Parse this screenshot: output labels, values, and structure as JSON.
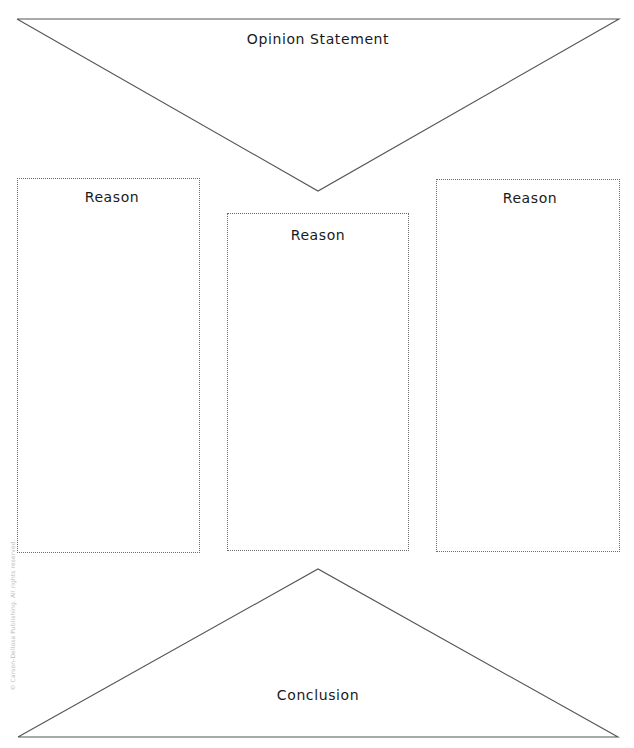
{
  "page": {
    "background_color": "#ffffff",
    "line_color": "#555555",
    "box_border_color": "#6b6b6b",
    "text_color": "#1a1a1a",
    "width": 634,
    "height": 748
  },
  "organizer": {
    "top_section": {
      "label": "Opinion Statement",
      "shape": "downward-triangle",
      "label_x": 318,
      "label_y": 39
    },
    "reason_boxes": [
      {
        "label": "Reason",
        "position": "left",
        "x": 17,
        "y": 178,
        "width": 183,
        "height": 375,
        "label_x": 112,
        "label_y": 197
      },
      {
        "label": "Reason",
        "position": "center",
        "x": 227,
        "y": 213,
        "width": 182,
        "height": 338,
        "label_x": 318,
        "label_y": 235
      },
      {
        "label": "Reason",
        "position": "right",
        "x": 436,
        "y": 179,
        "width": 184,
        "height": 373,
        "label_x": 530,
        "label_y": 198
      }
    ],
    "bottom_section": {
      "label": "Conclusion",
      "shape": "upward-triangle",
      "label_x": 318,
      "label_y": 695
    }
  },
  "footer": {
    "copyright": "© Carson-Dellosa Publishing. All rights reserved."
  }
}
